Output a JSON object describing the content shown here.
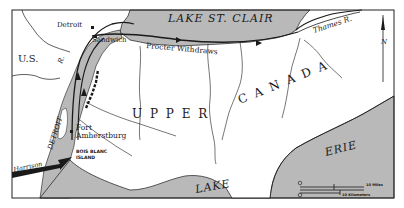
{
  "map": {
    "title_visible": false,
    "colors": {
      "water": "#b9b9b9",
      "land": "#ffffff",
      "ink": "#1a1a1a",
      "frame": "#222222"
    },
    "labels": {
      "lake_st_clair": "LAKE ST. CLAIR",
      "thames_river": "Thames R.",
      "detroit_city": "Detroit",
      "sandwich": "Sandwich",
      "procter_withdraws": "Procter Withdraws",
      "us": "U.S.",
      "river_r": "R.",
      "detroit_river": "DETROIT",
      "upper": "U P P E R",
      "canada": "C A N A D A",
      "fort_amherstburg_1": "Fort",
      "fort_amherstburg_2": "Amherstburg",
      "bois_blanc_1": "BOIS BLANC",
      "bois_blanc_2": "ISLAND",
      "harrison": "Harrison",
      "lake_erie_1": "LAKE",
      "lake_erie_2": "ERIE",
      "north_arrow": "N"
    },
    "scale_bar": {
      "miles_label": "10 Miles",
      "km_label": "10 Kilometers",
      "zero_top": "0",
      "zero_bottom": "0"
    }
  }
}
